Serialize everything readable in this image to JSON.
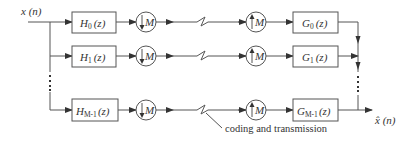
{
  "diagram": {
    "type": "block-diagram",
    "title": "",
    "input": {
      "label": "x (n)"
    },
    "output": {
      "label": "x̂ (n)"
    },
    "branches": [
      {
        "analysis_filter": {
          "label": "H",
          "sub": "0",
          "arg": "(z)"
        },
        "downsampler": {
          "label": "M",
          "direction": "down"
        },
        "upsampler": {
          "label": "M",
          "direction": "up"
        },
        "synthesis_filter": {
          "label": "G",
          "sub": "0",
          "arg": "(z)"
        }
      },
      {
        "analysis_filter": {
          "label": "H",
          "sub": "1",
          "arg": "(z)"
        },
        "downsampler": {
          "label": "M",
          "direction": "down"
        },
        "upsampler": {
          "label": "M",
          "direction": "up"
        },
        "synthesis_filter": {
          "label": "G",
          "sub": "1",
          "arg": "(z)"
        }
      },
      {
        "analysis_filter": {
          "label": "H",
          "sub": "M-1",
          "arg": "(z)"
        },
        "downsampler": {
          "label": "M",
          "direction": "down"
        },
        "upsampler": {
          "label": "M",
          "direction": "up"
        },
        "synthesis_filter": {
          "label": "G",
          "sub": "M-1",
          "arg": "(z)"
        }
      }
    ],
    "channel_annotation": "coding and transmission",
    "ellipsis": "⋮",
    "colors": {
      "line": "#555555",
      "text": "#333333",
      "background": "#ffffff"
    }
  }
}
